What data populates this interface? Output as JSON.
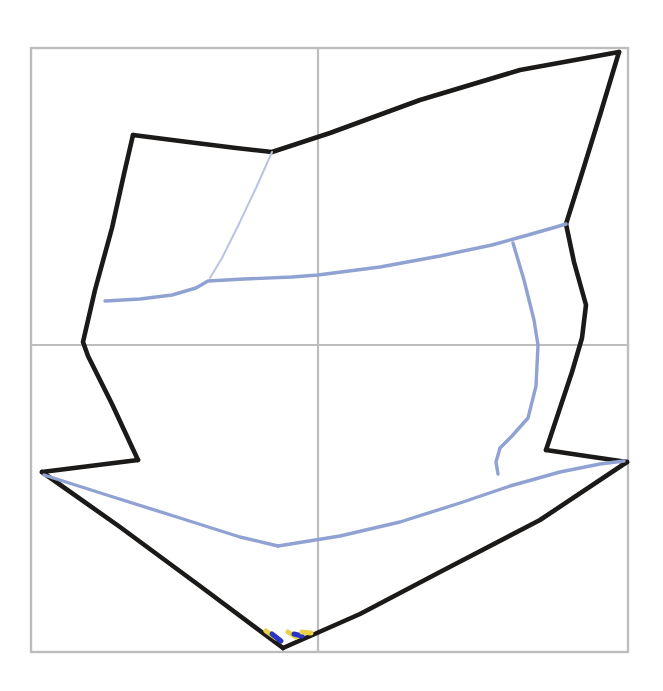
{
  "document": {
    "title": "Hand-drawn faceted sketch on grid paper",
    "width": 663,
    "height": 691,
    "background_color": "#ffffff",
    "description": "A pencil/ink line drawing of an angular faceted form (resembling a folded paper bird or arrow) overlaid on a light gray four-quadrant grid, with lighter blue-gray interior fold lines and two small yellow and blue color marks at the lower apex."
  },
  "palette": {
    "grid_gray": "#bdbdbd",
    "ink_black": "#1b1a18",
    "fold_blue": "#8fa2d2",
    "fold_blue_faint": "#b9c4e4",
    "mark_yellow": "#e9d24a",
    "mark_blue": "#2a35c8",
    "paper_white": "#ffffff"
  },
  "grid": {
    "name": "guide-grid",
    "bounds": {
      "left": 31,
      "top": 48,
      "right": 628,
      "bottom": 652
    },
    "vertical_lines_x": [
      318
    ],
    "horizontal_lines_y": [
      345
    ],
    "stroke": "#bdbdbd",
    "stroke_width": 2.2
  },
  "chart_data": {
    "type": "line",
    "xlabel": "",
    "ylabel": "",
    "xlim": [
      0,
      663
    ],
    "ylim": [
      0,
      691
    ],
    "grid": true,
    "legend": "none",
    "series": [
      {
        "name": "black-outline-upper-left",
        "color": "#1b1a18",
        "stroke_width": 4.6,
        "closed": false,
        "points": [
          [
            133,
            135
          ],
          [
            180,
            141
          ],
          [
            236,
            148
          ],
          [
            272,
            152
          ],
          [
            330,
            133
          ],
          [
            420,
            100
          ],
          [
            520,
            70
          ],
          [
            619,
            52
          ]
        ]
      },
      {
        "name": "black-outline-right-descent",
        "color": "#1b1a18",
        "stroke_width": 4.6,
        "closed": false,
        "points": [
          [
            619,
            52
          ],
          [
            600,
            115
          ],
          [
            583,
            170
          ],
          [
            566,
            224
          ],
          [
            574,
            262
          ],
          [
            586,
            305
          ],
          [
            582,
            338
          ],
          [
            572,
            372
          ],
          [
            560,
            408
          ],
          [
            546,
            450
          ]
        ]
      },
      {
        "name": "black-outline-right-notch",
        "color": "#1b1a18",
        "stroke_width": 4.6,
        "closed": false,
        "points": [
          [
            546,
            450
          ],
          [
            586,
            456
          ],
          [
            627,
            462
          ]
        ]
      },
      {
        "name": "black-outline-lower-right-wing",
        "color": "#1b1a18",
        "stroke_width": 4.6,
        "closed": false,
        "points": [
          [
            627,
            462
          ],
          [
            540,
            520
          ],
          [
            440,
            572
          ],
          [
            360,
            614
          ],
          [
            283,
            648
          ]
        ]
      },
      {
        "name": "black-outline-lower-left-wing",
        "color": "#1b1a18",
        "stroke_width": 4.6,
        "closed": false,
        "points": [
          [
            283,
            648
          ],
          [
            200,
            586
          ],
          [
            120,
            527
          ],
          [
            42,
            472
          ]
        ]
      },
      {
        "name": "black-outline-left-notch",
        "color": "#1b1a18",
        "stroke_width": 4.6,
        "closed": false,
        "points": [
          [
            42,
            472
          ],
          [
            90,
            466
          ],
          [
            138,
            460
          ]
        ]
      },
      {
        "name": "black-outline-left-ascent",
        "color": "#1b1a18",
        "stroke_width": 4.6,
        "closed": false,
        "points": [
          [
            138,
            460
          ],
          [
            112,
            404
          ],
          [
            88,
            356
          ],
          [
            83,
            342
          ],
          [
            95,
            290
          ],
          [
            112,
            228
          ],
          [
            124,
            174
          ],
          [
            133,
            135
          ]
        ]
      },
      {
        "name": "blue-fold-horizontal-band",
        "color": "#8fa2d2",
        "stroke_width": 3.4,
        "closed": false,
        "points": [
          [
            105,
            301
          ],
          [
            140,
            299
          ],
          [
            172,
            295
          ],
          [
            196,
            288
          ],
          [
            208,
            281
          ],
          [
            244,
            279
          ],
          [
            292,
            277
          ],
          [
            318,
            275
          ],
          [
            380,
            267
          ],
          [
            440,
            256
          ],
          [
            492,
            245
          ],
          [
            528,
            235
          ],
          [
            556,
            227
          ],
          [
            566,
            224
          ]
        ]
      },
      {
        "name": "blue-fold-diagonal-upper",
        "color": "#b9c4e4",
        "stroke_width": 2.0,
        "closed": false,
        "points": [
          [
            272,
            152
          ],
          [
            256,
            188
          ],
          [
            238,
            226
          ],
          [
            222,
            258
          ],
          [
            210,
            278
          ]
        ]
      },
      {
        "name": "blue-fold-vertical-right",
        "color": "#8fa2d2",
        "stroke_width": 3.4,
        "closed": false,
        "points": [
          [
            513,
            243
          ],
          [
            524,
            280
          ],
          [
            534,
            320
          ],
          [
            538,
            345
          ],
          [
            536,
            386
          ],
          [
            528,
            418
          ],
          [
            512,
            436
          ],
          [
            500,
            448
          ],
          [
            496,
            462
          ],
          [
            498,
            474
          ]
        ]
      },
      {
        "name": "blue-fold-bottom-left",
        "color": "#8fa2d2",
        "stroke_width": 3.4,
        "closed": false,
        "points": [
          [
            44,
            475
          ],
          [
            110,
            496
          ],
          [
            180,
            518
          ],
          [
            240,
            537
          ],
          [
            278,
            546
          ]
        ]
      },
      {
        "name": "blue-fold-bottom-right",
        "color": "#8fa2d2",
        "stroke_width": 3.4,
        "closed": false,
        "points": [
          [
            278,
            546
          ],
          [
            340,
            536
          ],
          [
            400,
            522
          ],
          [
            460,
            503
          ],
          [
            510,
            486
          ],
          [
            560,
            472
          ],
          [
            600,
            464
          ],
          [
            624,
            461
          ]
        ]
      }
    ],
    "marks": [
      {
        "name": "yellow-mark-left",
        "color": "#e9d24a",
        "points": [
          [
            266,
            631
          ],
          [
            276,
            638
          ]
        ]
      },
      {
        "name": "blue-mark-left",
        "color": "#2a35c8",
        "points": [
          [
            272,
            634
          ],
          [
            281,
            641
          ]
        ]
      },
      {
        "name": "yellow-mark-center",
        "color": "#e9d24a",
        "points": [
          [
            288,
            632
          ],
          [
            296,
            637
          ]
        ]
      },
      {
        "name": "blue-mark-right",
        "color": "#2a35c8",
        "points": [
          [
            294,
            634
          ],
          [
            302,
            636
          ]
        ]
      },
      {
        "name": "yellow-mark-right",
        "color": "#e9d24a",
        "points": [
          [
            302,
            632
          ],
          [
            311,
            633
          ]
        ]
      }
    ],
    "annotations": []
  }
}
